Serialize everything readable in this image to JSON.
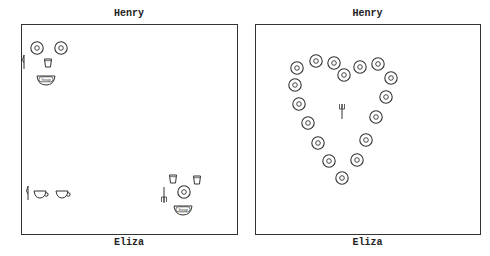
{
  "panels": [
    {
      "id": "left",
      "top_label": "Henry",
      "bottom_label": "Eliza",
      "items": {
        "henry_side": [
          "plate",
          "plate",
          "cup",
          "knife",
          "soup-bowl"
        ],
        "eliza_left": [
          "knife",
          "teacup",
          "teacup"
        ],
        "eliza_right": [
          "cup",
          "cup",
          "fork",
          "plate",
          "soup-bowl"
        ]
      },
      "soup_label": "Soup"
    },
    {
      "id": "right",
      "top_label": "Henry",
      "bottom_label": "Eliza",
      "items": {
        "heart_plates": 18,
        "center": [
          "fork"
        ]
      }
    }
  ],
  "colors": {
    "ink": "#333333",
    "background": "#ffffff"
  }
}
